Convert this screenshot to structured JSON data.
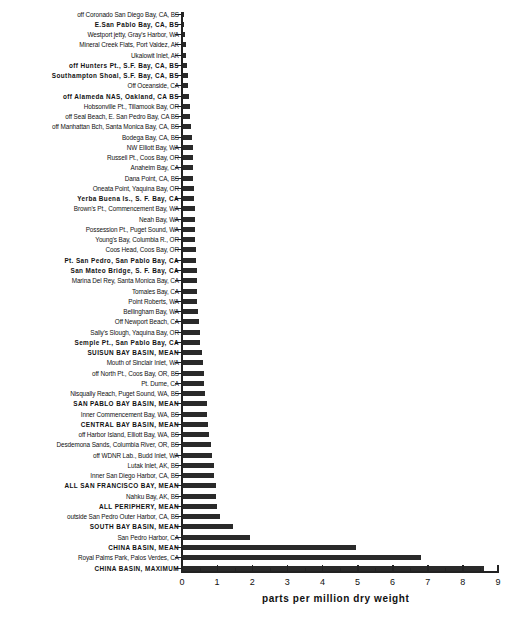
{
  "chart_data": {
    "type": "bar",
    "orientation": "horizontal",
    "title": "",
    "xlabel": "parts per million dry weight",
    "ylabel": "",
    "xlim": [
      0,
      9
    ],
    "xticks": [
      "0",
      "1",
      "2",
      "3",
      "4",
      "5",
      "6",
      "7",
      "8",
      "9"
    ],
    "grid": false,
    "legend": null,
    "categories": [
      "off Coronado San Diego Bay, CA, BS",
      "E.San Pablo Bay, CA, BS",
      "Westport jetty, Gray's Harbor, WA",
      "Mineral Creek Flats, Port Valdez, AK",
      "Ukalowit Inlet, AK",
      "off Hunters Pt., S.F. Bay, CA, BS",
      "Southampton Shoal, S.F. Bay, CA, BS",
      "Off Oceanside, CA",
      "off Alameda NAS, Oakland, CA BS",
      "Hobsonville Pt., Tillamook Bay, OR",
      "off Seal Beach, E. San Pedro Bay, CA BS",
      "off Manhattan Bch, Santa Monica Bay, CA, BS",
      "Bodega Bay, CA, BS",
      "NW Elliott Bay, WA",
      "Russell Pt., Coos Bay, OR",
      "Anaheim Bay, CA",
      "Dana Point, CA, BS",
      "Oneata Point, Yaquina Bay, OR",
      "Yerba Buena Is., S. F. Bay, CA",
      "Brown's Pt., Commencement Bay, WA",
      "Neah Bay, WA",
      "Possession Pt., Puget Sound, WA",
      "Young's Bay, Columbia R., OR",
      "Coos Head, Coos Bay, OR",
      "Pt. San Pedro, San Pablo Bay, CA",
      "San Mateo Bridge, S. F. Bay, CA",
      "Marina Del Rey, Santa Monica Bay, CA",
      "Tomales Bay, CA",
      "Point Roberts, WA",
      "Bellingham Bay, WA",
      "Off Newport Beach, CA",
      "Sally's Slough, Yaquina Bay, OR",
      "Semple Pt., San Pablo Bay, CA",
      "SUISUN BAY BASIN, MEAN",
      "Mouth of Sinclair Inlet, WA",
      "off North Pt., Coos Bay, OR, BS",
      "Pt. Dume, CA",
      "Nisqually Reach, Puget Sound, WA, BS",
      "SAN PABLO BAY BASIN, MEAN",
      "Inner Commencement Bay, WA, BS",
      "CENTRAL BAY BASIN, MEAN",
      "off Harbor Island, Elliott Bay, WA, BS",
      "Desdemona Sands, Columbia River, OR, BS",
      "off WDNR Lab., Budd Inlet, WA",
      "Lutak Inlet, AK, BS",
      "Inner San Diego Harbor, CA, BS",
      "ALL SAN FRANCISCO BAY, MEAN",
      "Nahku Bay, AK, BS",
      "ALL PERIPHERY, MEAN",
      "outside San Pedro Outer Harbor, CA, BS",
      "SOUTH BAY BASIN, MEAN",
      "San Pedro Harbor, CA",
      "CHINA BASIN, MEAN",
      "Royal Palms Park, Palos Verdes, CA",
      "CHINA BASIN, MAXIMUM"
    ],
    "bold": [
      false,
      true,
      false,
      false,
      false,
      true,
      true,
      false,
      true,
      false,
      false,
      false,
      false,
      false,
      false,
      false,
      false,
      false,
      true,
      false,
      false,
      false,
      false,
      false,
      true,
      true,
      false,
      false,
      false,
      false,
      false,
      false,
      true,
      true,
      false,
      false,
      false,
      false,
      true,
      false,
      true,
      false,
      false,
      false,
      false,
      false,
      true,
      false,
      true,
      false,
      true,
      false,
      true,
      false,
      true
    ],
    "values": [
      0.02,
      0.05,
      0.08,
      0.1,
      0.12,
      0.14,
      0.16,
      0.18,
      0.2,
      0.22,
      0.24,
      0.26,
      0.28,
      0.3,
      0.3,
      0.32,
      0.32,
      0.34,
      0.34,
      0.36,
      0.36,
      0.38,
      0.38,
      0.4,
      0.4,
      0.42,
      0.42,
      0.44,
      0.44,
      0.46,
      0.48,
      0.5,
      0.52,
      0.56,
      0.6,
      0.62,
      0.64,
      0.66,
      0.7,
      0.72,
      0.74,
      0.78,
      0.82,
      0.86,
      0.9,
      0.92,
      0.96,
      0.98,
      1.0,
      1.08,
      1.45,
      1.95,
      4.95,
      6.8,
      8.6
    ]
  }
}
